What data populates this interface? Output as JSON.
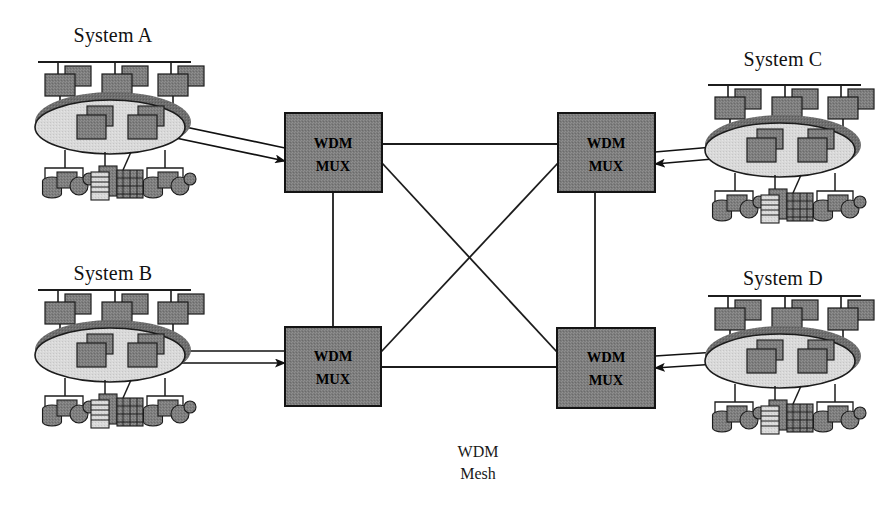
{
  "diagram": {
    "center_label_line1": "WDM",
    "center_label_line2": "Mesh",
    "background_color": "#ffffff"
  },
  "colors": {
    "device_fill": "#7a7a7a",
    "device_stroke": "#1c1c1c",
    "cloud_fill": "#d8d8d8",
    "cloud_band": "#6e6e6e",
    "cloud_stroke": "#1c1c1c",
    "mux_fill": "#7d7d7d",
    "mux_stroke": "#141414",
    "line_color": "#1c1c1c",
    "text_color": "#111111"
  },
  "systems": [
    {
      "id": "system-a",
      "label": "System A",
      "position": "top-left",
      "cx": 113,
      "cy": 124,
      "title_x": 113,
      "title_y": 42,
      "arrow_side": "right",
      "workstations": 3,
      "inner_nodes": 2,
      "peripheral_groups": 4
    },
    {
      "id": "system-b",
      "label": "System B",
      "position": "bottom-left",
      "cx": 113,
      "cy": 352,
      "title_x": 113,
      "title_y": 280,
      "arrow_side": "right",
      "workstations": 3,
      "inner_nodes": 2,
      "peripheral_groups": 4
    },
    {
      "id": "system-c",
      "label": "System C",
      "position": "top-right",
      "cx": 783,
      "cy": 147,
      "title_x": 783,
      "title_y": 66,
      "arrow_side": "left",
      "workstations": 3,
      "inner_nodes": 2,
      "peripheral_groups": 4
    },
    {
      "id": "system-d",
      "label": "System D",
      "position": "bottom-right",
      "cx": 783,
      "cy": 358,
      "title_x": 783,
      "title_y": 285,
      "arrow_side": "left",
      "workstations": 3,
      "inner_nodes": 2,
      "peripheral_groups": 4
    }
  ],
  "mux_nodes": [
    {
      "id": "mux-top-left",
      "line1": "WDM",
      "line2": "MUX",
      "x": 285,
      "y": 113,
      "w": 97,
      "h": 79
    },
    {
      "id": "mux-top-right",
      "line1": "WDM",
      "line2": "MUX",
      "x": 558,
      "y": 113,
      "w": 97,
      "h": 79
    },
    {
      "id": "mux-bottom-left",
      "line1": "WDM",
      "line2": "MUX",
      "x": 285,
      "y": 327,
      "w": 96,
      "h": 79
    },
    {
      "id": "mux-bottom-right",
      "line1": "WDM",
      "line2": "MUX",
      "x": 557,
      "y": 328,
      "w": 98,
      "h": 80
    }
  ],
  "mesh_links": [
    {
      "id": "link-top",
      "from": "mux-top-left",
      "to": "mux-top-right",
      "x1": 382,
      "y1": 144,
      "x2": 558,
      "y2": 144
    },
    {
      "id": "link-bottom",
      "from": "mux-bottom-left",
      "to": "mux-bottom-right",
      "x1": 381,
      "y1": 367,
      "x2": 557,
      "y2": 367
    },
    {
      "id": "link-left-vertical",
      "from": "mux-top-left",
      "to": "mux-bottom-left",
      "x1": 333,
      "y1": 192,
      "x2": 333,
      "y2": 327
    },
    {
      "id": "link-right-vertical",
      "from": "mux-top-right",
      "to": "mux-bottom-right",
      "x1": 595,
      "y1": 192,
      "x2": 595,
      "y2": 328
    },
    {
      "id": "link-diagonal-a",
      "from": "mux-top-left",
      "to": "mux-bottom-right",
      "x1": 382,
      "y1": 163,
      "x2": 557,
      "y2": 352
    },
    {
      "id": "link-diagonal-b",
      "from": "mux-top-right",
      "to": "mux-bottom-left",
      "x1": 558,
      "y1": 163,
      "x2": 381,
      "y2": 352
    }
  ],
  "system_links": [
    {
      "id": "feed-system-a",
      "system": "system-a",
      "mux": "mux-top-left",
      "x1": 150,
      "y1": 124,
      "x2": 285,
      "y2": 152
    },
    {
      "id": "feed-system-b",
      "system": "system-b",
      "mux": "mux-bottom-left",
      "x1": 150,
      "y1": 355,
      "x2": 285,
      "y2": 355
    },
    {
      "id": "feed-system-c",
      "system": "system-c",
      "mux": "mux-top-right",
      "x1": 745,
      "y1": 158,
      "x2": 655,
      "y2": 152
    },
    {
      "id": "feed-system-d",
      "system": "system-d",
      "mux": "mux-bottom-right",
      "x1": 745,
      "y1": 360,
      "x2": 655,
      "y2": 358
    }
  ]
}
